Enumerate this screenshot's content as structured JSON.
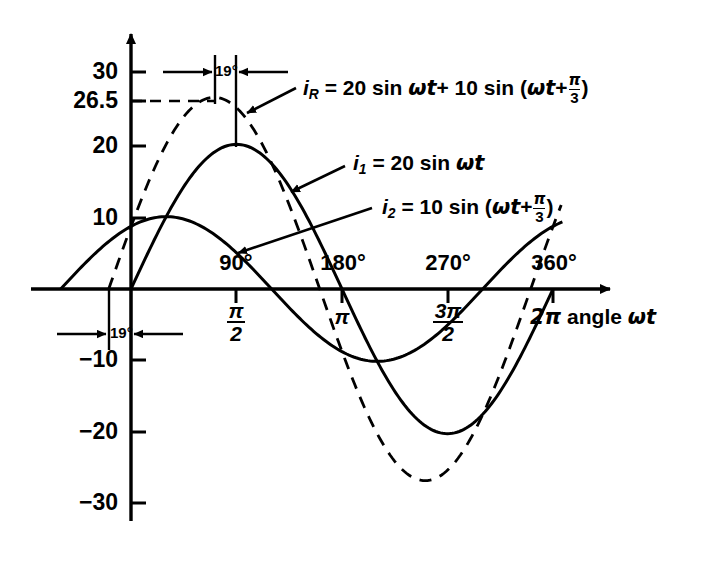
{
  "chart_data": {
    "type": "line",
    "title": "",
    "xlabel": "2π angle ωt",
    "ylabel": "",
    "xlim": [
      -60,
      375
    ],
    "ylim": [
      -33,
      33
    ],
    "grid": false,
    "legend": "inline-annotations",
    "x_unit": "degrees",
    "x_ticks_deg": [
      90,
      180,
      270,
      360
    ],
    "x_tick_labels_deg": [
      "90°",
      "180°",
      "270°",
      "360°"
    ],
    "x_tick_labels_rad": [
      "π/2",
      "π",
      "3π/2",
      "2π"
    ],
    "y_ticks": [
      30,
      26.5,
      20,
      10,
      -10,
      -20,
      -30
    ],
    "y_tick_labels": [
      "30",
      "26.5",
      "20",
      "10",
      "−10",
      "−20",
      "−30"
    ],
    "series": [
      {
        "name": "i_1",
        "label": "i1 = 20 sin ωt",
        "style": "solid",
        "amplitude": 20,
        "phase_deg": 0,
        "peak_value": 20,
        "peak_at_deg": 90,
        "trough_value": -20,
        "trough_at_deg": 270,
        "zero_crossings_deg": [
          0,
          180,
          360
        ]
      },
      {
        "name": "i_2",
        "label": "i2 = 10 sin (ωt + π/3)",
        "style": "solid",
        "amplitude": 10,
        "phase_deg": 60,
        "peak_value": 10,
        "peak_at_deg": 30,
        "trough_value": -10,
        "trough_at_deg": 210,
        "zero_crossings_deg": [
          -60,
          120,
          300
        ],
        "value_at_zero_deg": 8.66
      },
      {
        "name": "i_R",
        "label": "iR = 20 sin ωt + 10 sin (ωt + π/3)",
        "style": "dashed",
        "amplitude": 26.5,
        "phase_deg": 19,
        "peak_value": 26.5,
        "peak_at_deg": 71,
        "trough_value": -26.5,
        "trough_at_deg": 251,
        "zero_crossings_deg": [
          -19,
          161,
          341
        ],
        "value_at_zero_deg": 8.66
      }
    ],
    "annotations": [
      {
        "name": "phase-shift-top",
        "text": "19°",
        "meaning": "phase lead of resultant peak before 90°"
      },
      {
        "name": "phase-shift-bottom",
        "text": "19°",
        "meaning": "phase lead of resultant zero crossing before 0°"
      },
      {
        "name": "peak-guide",
        "text": "26.5",
        "meaning": "dashed horizontal guide to resultant peak"
      }
    ]
  },
  "yticks": [
    {
      "label": "30",
      "value": 30
    },
    {
      "label": "26.5",
      "value": 26.5
    },
    {
      "label": "20",
      "value": 20
    },
    {
      "label": "10",
      "value": 10
    },
    {
      "label": "−10",
      "value": -10
    },
    {
      "label": "−20",
      "value": -20
    },
    {
      "label": "−30",
      "value": -30
    }
  ],
  "xticks": [
    {
      "deg": "90°",
      "num": "π",
      "den": "2",
      "value": 90
    },
    {
      "deg": "180°",
      "num": "π",
      "den": "",
      "value": 180
    },
    {
      "deg": "270°",
      "num": "3π",
      "den": "2",
      "value": 270
    },
    {
      "deg": "360°",
      "num": "",
      "den": "",
      "value": 360
    }
  ],
  "equations": {
    "ir": {
      "var": "i",
      "sub": "R",
      "eq": "= 20 sin",
      "omega_t": "ωt",
      "plus": "+ 10 sin (",
      "omega_t2": "ωt",
      "plus2": "+",
      "frac_num": "π",
      "frac_den": "3",
      "close": ")"
    },
    "i1": {
      "var": "i",
      "sub": "1",
      "eq": "= 20 sin",
      "omega_t": "ωt"
    },
    "i2": {
      "var": "i",
      "sub": "2",
      "eq": "= 10 sin (",
      "omega_t": "ωt",
      "plus": "+",
      "frac_num": "π",
      "frac_den": "3",
      "close": ")"
    }
  },
  "annotations": {
    "angle_top": "19°",
    "angle_bottom": "19°"
  },
  "axis": {
    "x_title_pre": "2π",
    "x_title_mid": "angle",
    "x_title_var": "ωt"
  },
  "colors": {
    "ink": "#000000",
    "background": "#ffffff"
  }
}
